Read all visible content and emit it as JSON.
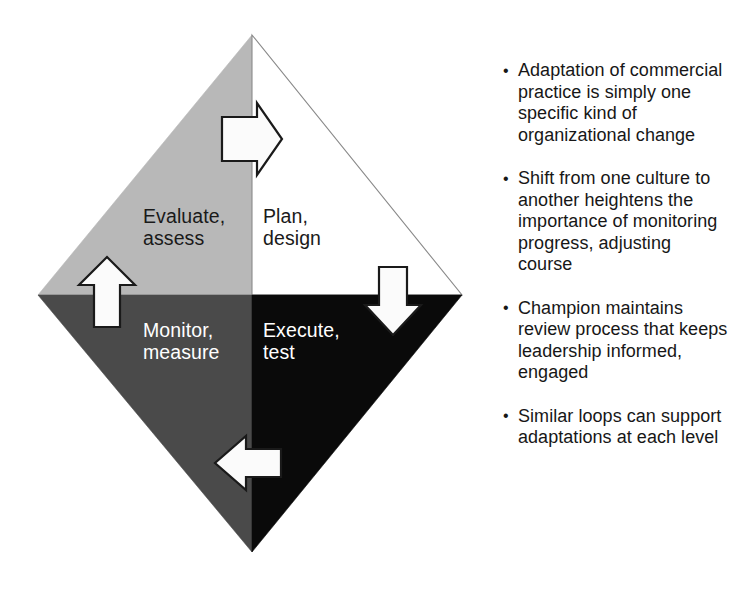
{
  "diagram": {
    "name": "adaptation-cycle-diamond",
    "shape": "diamond",
    "colors": {
      "upper_left_fill": "#b8b8b8",
      "upper_right_fill": "#ffffff",
      "lower_left_fill": "#4a4a4a",
      "lower_right_fill": "#0a0a0a",
      "outline": "#8a8a8a",
      "arrow_fill": "#fbfbfb",
      "arrow_stroke": "#1a1a1a",
      "dark_text": "#1a1a1a",
      "light_text": "#ffffff"
    },
    "quadrants": [
      {
        "id": "evaluate-assess",
        "label": "Evaluate,\nassess",
        "position": "upper-left",
        "fill": "#b8b8b8",
        "text_color": "#1a1a1a"
      },
      {
        "id": "plan-design",
        "label": "Plan,\ndesign",
        "position": "upper-right",
        "fill": "#ffffff",
        "text_color": "#1a1a1a"
      },
      {
        "id": "monitor-measure",
        "label": "Monitor,\nmeasure",
        "position": "lower-left",
        "fill": "#4a4a4a",
        "text_color": "#ffffff"
      },
      {
        "id": "execute-test",
        "label": "Execute,\ntest",
        "position": "lower-right",
        "fill": "#0a0a0a",
        "text_color": "#ffffff"
      }
    ],
    "arrows": [
      {
        "id": "arrow-right",
        "icon": "arrow-right-icon",
        "direction": "right",
        "location": "top-center"
      },
      {
        "id": "arrow-down",
        "icon": "arrow-down-icon",
        "direction": "down",
        "location": "right-center"
      },
      {
        "id": "arrow-left",
        "icon": "arrow-left-icon",
        "direction": "left",
        "location": "bottom-center"
      },
      {
        "id": "arrow-up",
        "icon": "arrow-up-icon",
        "direction": "up",
        "location": "left-center"
      }
    ]
  },
  "bullets": [
    {
      "marker": "•",
      "text": "Adaptation of commercial practice is simply one specific kind of organizational change"
    },
    {
      "marker": "•",
      "text": "Shift from one culture to another heightens the importance of monitoring progress, adjusting course"
    },
    {
      "marker": "•",
      "text": "Champion maintains review process that keeps leadership informed, engaged"
    },
    {
      "marker": "•",
      "text": "Similar loops can support adaptations at each level"
    }
  ]
}
